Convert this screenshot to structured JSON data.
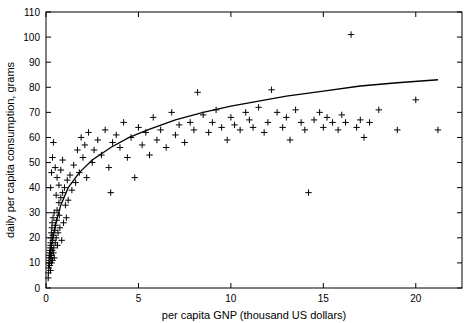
{
  "chart_data": {
    "type": "scatter",
    "title": "",
    "xlabel": "per capita GNP (thousand US dollars)",
    "ylabel": "daily per capita consumption, grams",
    "xlim": [
      0,
      22.5
    ],
    "ylim": [
      0,
      110
    ],
    "xticks": [
      0,
      5,
      10,
      15,
      20
    ],
    "yticks": [
      0,
      10,
      20,
      30,
      40,
      50,
      60,
      70,
      80,
      90,
      100,
      110
    ],
    "grid": false,
    "legend": null,
    "marker": "plus",
    "series": [
      {
        "name": "countries",
        "points": [
          [
            0.12,
            4
          ],
          [
            0.13,
            6
          ],
          [
            0.15,
            8
          ],
          [
            0.16,
            10
          ],
          [
            0.17,
            12
          ],
          [
            0.18,
            13
          ],
          [
            0.19,
            14
          ],
          [
            0.2,
            9
          ],
          [
            0.21,
            11
          ],
          [
            0.22,
            15
          ],
          [
            0.23,
            16
          ],
          [
            0.24,
            7
          ],
          [
            0.25,
            17
          ],
          [
            0.26,
            18
          ],
          [
            0.27,
            12
          ],
          [
            0.28,
            20
          ],
          [
            0.29,
            22
          ],
          [
            0.3,
            10
          ],
          [
            0.31,
            13
          ],
          [
            0.32,
            24
          ],
          [
            0.33,
            26
          ],
          [
            0.34,
            15
          ],
          [
            0.35,
            11
          ],
          [
            0.36,
            19
          ],
          [
            0.37,
            21
          ],
          [
            0.38,
            28
          ],
          [
            0.4,
            14
          ],
          [
            0.42,
            16
          ],
          [
            0.44,
            30
          ],
          [
            0.45,
            12
          ],
          [
            0.48,
            23
          ],
          [
            0.5,
            18
          ],
          [
            0.52,
            25
          ],
          [
            0.55,
            20
          ],
          [
            0.58,
            27
          ],
          [
            0.6,
            31
          ],
          [
            0.62,
            17
          ],
          [
            0.65,
            22
          ],
          [
            0.7,
            34
          ],
          [
            0.72,
            29
          ],
          [
            0.75,
            24
          ],
          [
            0.8,
            36
          ],
          [
            0.85,
            19
          ],
          [
            0.9,
            38
          ],
          [
            0.95,
            26
          ],
          [
            1.0,
            40
          ],
          [
            1.05,
            33
          ],
          [
            1.1,
            28
          ],
          [
            1.15,
            43
          ],
          [
            1.2,
            35
          ],
          [
            0.25,
            40
          ],
          [
            0.3,
            46
          ],
          [
            0.35,
            52
          ],
          [
            0.4,
            58
          ],
          [
            0.5,
            48
          ],
          [
            0.55,
            37
          ],
          [
            0.6,
            44
          ],
          [
            0.7,
            41
          ],
          [
            0.8,
            47
          ],
          [
            0.9,
            51
          ],
          [
            1.3,
            45
          ],
          [
            1.4,
            39
          ],
          [
            1.5,
            49
          ],
          [
            1.6,
            42
          ],
          [
            1.7,
            55
          ],
          [
            1.8,
            46
          ],
          [
            1.9,
            60
          ],
          [
            2.0,
            52
          ],
          [
            2.1,
            57
          ],
          [
            2.2,
            44
          ],
          [
            2.3,
            62
          ],
          [
            2.5,
            50
          ],
          [
            2.6,
            55
          ],
          [
            2.8,
            59
          ],
          [
            3.0,
            53
          ],
          [
            3.2,
            63
          ],
          [
            3.4,
            48
          ],
          [
            3.5,
            38
          ],
          [
            3.6,
            58
          ],
          [
            3.8,
            61
          ],
          [
            4.0,
            56
          ],
          [
            4.2,
            66
          ],
          [
            4.4,
            52
          ],
          [
            4.6,
            60
          ],
          [
            4.8,
            44
          ],
          [
            5.0,
            64
          ],
          [
            5.2,
            57
          ],
          [
            5.4,
            62
          ],
          [
            5.6,
            53
          ],
          [
            5.8,
            68
          ],
          [
            6.0,
            59
          ],
          [
            6.2,
            63
          ],
          [
            6.5,
            56
          ],
          [
            6.8,
            70
          ],
          [
            7.0,
            61
          ],
          [
            7.2,
            65
          ],
          [
            7.5,
            58
          ],
          [
            7.8,
            66
          ],
          [
            8.0,
            63
          ],
          [
            8.2,
            78
          ],
          [
            8.5,
            69
          ],
          [
            8.8,
            62
          ],
          [
            9.0,
            66
          ],
          [
            9.2,
            71
          ],
          [
            9.5,
            64
          ],
          [
            9.8,
            59
          ],
          [
            10.0,
            68
          ],
          [
            10.2,
            65
          ],
          [
            10.5,
            63
          ],
          [
            10.8,
            70
          ],
          [
            11.0,
            67
          ],
          [
            11.2,
            64
          ],
          [
            11.5,
            72
          ],
          [
            11.8,
            62
          ],
          [
            12.0,
            66
          ],
          [
            12.2,
            79
          ],
          [
            12.5,
            70
          ],
          [
            12.8,
            64
          ],
          [
            13.0,
            68
          ],
          [
            13.2,
            59
          ],
          [
            13.5,
            71
          ],
          [
            13.8,
            66
          ],
          [
            14.0,
            63
          ],
          [
            14.2,
            38
          ],
          [
            14.5,
            67
          ],
          [
            14.8,
            70
          ],
          [
            15.0,
            64
          ],
          [
            15.2,
            68
          ],
          [
            15.5,
            66
          ],
          [
            15.8,
            63
          ],
          [
            16.0,
            69
          ],
          [
            16.2,
            66
          ],
          [
            16.5,
            101
          ],
          [
            16.8,
            64
          ],
          [
            17.0,
            67
          ],
          [
            17.2,
            60
          ],
          [
            17.5,
            66
          ],
          [
            18.0,
            71
          ],
          [
            19.0,
            63
          ],
          [
            20.0,
            75
          ],
          [
            21.2,
            63
          ]
        ]
      }
    ],
    "fit_curve": {
      "name": "logarithmic fit",
      "description": "smooth increasing curve through scatter",
      "points": [
        [
          0.15,
          8
        ],
        [
          0.3,
          17
        ],
        [
          0.5,
          25
        ],
        [
          0.8,
          33
        ],
        [
          1.2,
          40
        ],
        [
          1.8,
          46
        ],
        [
          2.5,
          51
        ],
        [
          3.5,
          56
        ],
        [
          4.5,
          60
        ],
        [
          5.5,
          63
        ],
        [
          7.0,
          67
        ],
        [
          8.5,
          70
        ],
        [
          10.0,
          72.5
        ],
        [
          11.5,
          74.5
        ],
        [
          13.0,
          76.5
        ],
        [
          15.0,
          78.5
        ],
        [
          17.0,
          80.5
        ],
        [
          19.0,
          81.8
        ],
        [
          21.2,
          83
        ]
      ]
    }
  }
}
